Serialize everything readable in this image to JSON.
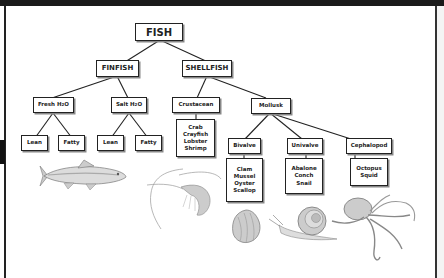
{
  "diagram": {
    "root": "FISH",
    "level1": [
      "FINFISH",
      "SHELLFISH"
    ],
    "finfish": {
      "groups": [
        {
          "label": "Fresh H",
          "sub": "2",
          "suffix": "O",
          "children": [
            "Lean",
            "Fatty"
          ]
        },
        {
          "label": "Salt H",
          "sub": "2",
          "suffix": "O",
          "children": [
            "Lean",
            "Fatty"
          ]
        }
      ]
    },
    "shellfish": {
      "crustacean": {
        "label": "Crustacean",
        "examples": [
          "Crab",
          "Crayfish",
          "Lobster",
          "Shrimp"
        ]
      },
      "mollusk": {
        "label": "Mollusk",
        "groups": [
          {
            "label": "Bivalve",
            "examples": [
              "Clam",
              "Mussel",
              "Oyster",
              "Scallop"
            ]
          },
          {
            "label": "Univalve",
            "examples": [
              "Abalone",
              "Conch",
              "Snail"
            ]
          },
          {
            "label": "Cephalopod",
            "examples": [
              "Octopus",
              "Squid"
            ]
          }
        ]
      }
    },
    "illustrations": [
      "fish-illustration",
      "shrimp-illustration",
      "shell-illustration",
      "snail-illustration",
      "octopus-illustration"
    ]
  },
  "colors": {
    "line": "#222222",
    "frame": "#1a1a1a",
    "background": "#ffffff"
  }
}
